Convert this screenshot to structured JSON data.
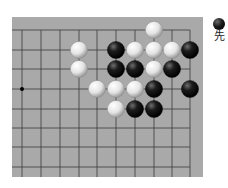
{
  "board": {
    "background": "#a9a9a9",
    "line_color": "#3a3a3a",
    "columns_x": [
      22,
      41,
      60,
      79,
      97,
      116,
      135,
      154,
      172,
      190
    ],
    "rows_y": [
      30,
      50,
      69,
      89,
      109,
      128,
      147,
      167
    ],
    "edges": {
      "top": true,
      "right": true,
      "left": false,
      "bottom": false
    },
    "star_points": [
      {
        "col": 0,
        "row": 3
      }
    ],
    "stones": [
      {
        "color": "white",
        "col": 7,
        "row": 0
      },
      {
        "color": "white",
        "col": 3,
        "row": 1
      },
      {
        "color": "black",
        "col": 5,
        "row": 1
      },
      {
        "color": "white",
        "col": 6,
        "row": 1
      },
      {
        "color": "white",
        "col": 7,
        "row": 1
      },
      {
        "color": "white",
        "col": 8,
        "row": 1
      },
      {
        "color": "black",
        "col": 9,
        "row": 1
      },
      {
        "color": "white",
        "col": 3,
        "row": 2
      },
      {
        "color": "black",
        "col": 5,
        "row": 2
      },
      {
        "color": "black",
        "col": 6,
        "row": 2
      },
      {
        "color": "white",
        "col": 7,
        "row": 2
      },
      {
        "color": "black",
        "col": 8,
        "row": 2
      },
      {
        "color": "white",
        "col": 4,
        "row": 3
      },
      {
        "color": "white",
        "col": 5,
        "row": 3
      },
      {
        "color": "white",
        "col": 6,
        "row": 3
      },
      {
        "color": "black",
        "col": 7,
        "row": 3
      },
      {
        "color": "black",
        "col": 9,
        "row": 3
      },
      {
        "color": "white",
        "col": 5,
        "row": 4
      },
      {
        "color": "black",
        "col": 6,
        "row": 4
      },
      {
        "color": "black",
        "col": 7,
        "row": 4
      }
    ]
  },
  "legend": {
    "to_move": "black",
    "label": "先"
  }
}
